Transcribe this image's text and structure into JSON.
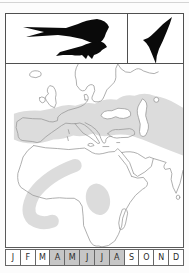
{
  "icons": {
    "left_panel": "perched-swallows-silhouette",
    "right_panel": "flying-swift-silhouette"
  },
  "map": {
    "content": "Europe, North Africa, Middle East and South Asia outline map",
    "shaded_regions": [
      "mediterranean-to-central-asia-band",
      "west-africa-arc",
      "central-east-africa-patch"
    ]
  },
  "calendar": {
    "months": [
      {
        "label": "J",
        "active": false
      },
      {
        "label": "F",
        "active": false
      },
      {
        "label": "M",
        "active": false
      },
      {
        "label": "A",
        "active": true
      },
      {
        "label": "M",
        "active": true
      },
      {
        "label": "J",
        "active": true
      },
      {
        "label": "J",
        "active": true
      },
      {
        "label": "A",
        "active": true
      },
      {
        "label": "S",
        "active": false
      },
      {
        "label": "O",
        "active": false
      },
      {
        "label": "N",
        "active": false
      },
      {
        "label": "D",
        "active": false
      }
    ]
  },
  "colors": {
    "range_shading": "#dcdcdc",
    "active_month": "#c6c6c6",
    "coastline": "#9a9a9a",
    "frame": "#4f4f4f",
    "silhouette": "#0a0a0a",
    "page_background": "#fcfcfc"
  }
}
